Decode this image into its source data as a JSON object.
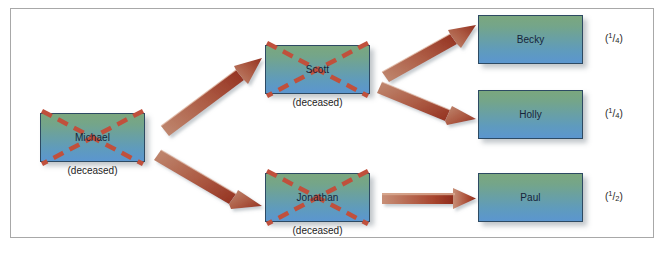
{
  "diagram": {
    "type": "inheritance-distribution-flow",
    "title": "",
    "colors": {
      "box_gradient_top": "#7ba77e",
      "box_gradient_bottom": "#5b96cf",
      "box_border": "#2d4a63",
      "cross_mark": "#c0503c",
      "arrow_light": "#c98a6e",
      "arrow_dark": "#a03828",
      "frame_border": "#a8a8a8",
      "text": "#1d1d1d"
    },
    "deceased_label": "(deceased)",
    "nodes": [
      {
        "id": "michael",
        "name": "Michael",
        "deceased": true,
        "share": null,
        "generation": 0,
        "x": 40,
        "y": 113,
        "w": 105,
        "h": 49
      },
      {
        "id": "scott",
        "name": "Scott",
        "deceased": true,
        "share": null,
        "generation": 1,
        "x": 265,
        "y": 45,
        "w": 105,
        "h": 49
      },
      {
        "id": "jonathan",
        "name": "Jonathan",
        "deceased": true,
        "share": null,
        "generation": 1,
        "x": 265,
        "y": 173,
        "w": 105,
        "h": 49
      },
      {
        "id": "becky",
        "name": "Becky",
        "deceased": false,
        "share": {
          "numerator": "1",
          "denominator": "4"
        },
        "generation": 2,
        "x": 478,
        "y": 15,
        "w": 105,
        "h": 49
      },
      {
        "id": "holly",
        "name": "Holly",
        "deceased": false,
        "share": {
          "numerator": "1",
          "denominator": "4"
        },
        "generation": 2,
        "x": 478,
        "y": 90,
        "w": 105,
        "h": 49
      },
      {
        "id": "paul",
        "name": "Paul",
        "deceased": false,
        "share": {
          "numerator": "1",
          "denominator": "2"
        },
        "generation": 2,
        "x": 478,
        "y": 173,
        "w": 105,
        "h": 49
      }
    ],
    "edges": [
      {
        "id": "michael-to-scott",
        "from": "michael",
        "to": "scott"
      },
      {
        "id": "michael-to-jonathan",
        "from": "michael",
        "to": "jonathan"
      },
      {
        "id": "scott-to-becky",
        "from": "scott",
        "to": "becky"
      },
      {
        "id": "scott-to-holly",
        "from": "scott",
        "to": "holly"
      },
      {
        "id": "jonathan-to-paul",
        "from": "jonathan",
        "to": "paul"
      }
    ]
  }
}
